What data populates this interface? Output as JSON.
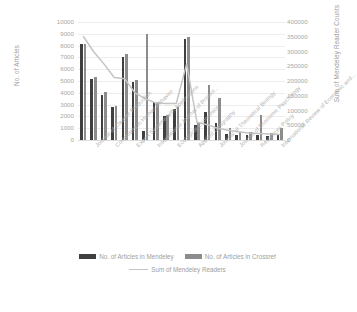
{
  "chart_data": {
    "type": "bar",
    "title": "",
    "xlabel": "",
    "ylabel": "No. of Articles",
    "y2label": "Sum of Mendeley Reader Counts",
    "ylim": [
      0,
      10000
    ],
    "y2lim": [
      0,
      400000
    ],
    "grid": true,
    "legend_position": "bottom",
    "categories": [
      "Journal of Cleaner Production",
      "Computers in Human Behavior",
      "Expert Systems with Applications",
      "International Journal of Project…",
      "Ecological Economics",
      "Applied Geography",
      "Journal of Theoretical Biology",
      "Journal of Economic Psychology",
      "Resources Policy",
      "International Review of Economic and…"
    ],
    "yticks": [
      "0",
      "1000",
      "2000",
      "3000",
      "4000",
      "5000",
      "6000",
      "7000",
      "8000",
      "9000",
      "10000"
    ],
    "y2ticks": [
      "0",
      "50000",
      "100000",
      "150000",
      "200000",
      "250000",
      "300000",
      "350000",
      "400000"
    ],
    "series": [
      {
        "name": "No. of Articles in Mendeley",
        "type": "bar",
        "axis": "left",
        "color": "#3f3f3f",
        "values": [
          8150,
          5200,
          3800,
          2800,
          7050,
          4900,
          800,
          3200,
          2050,
          2600
        ]
      },
      {
        "name": "No. of Articles in Crossref",
        "type": "bar",
        "axis": "left",
        "color": "#8c8c8c",
        "values": [
          8150,
          5350,
          4050,
          2900,
          7300,
          5050,
          8950,
          3200,
          2150,
          2800
        ]
      },
      {
        "name": "Sum of Mendeley Readers",
        "type": "line",
        "axis": "right",
        "color": "#c4c4c4",
        "values": [
          352000,
          300000,
          258000,
          212000,
          208000,
          160000,
          140000,
          126000,
          124000,
          124000
        ]
      }
    ],
    "series2": [
      {
        "name": "No. of Articles in Mendeley",
        "values": [
          8600,
          1250,
          2350,
          1400,
          500,
          450,
          400,
          420,
          380,
          400
        ]
      },
      {
        "name": "No. of Articles in Crossref",
        "values": [
          8700,
          1400,
          4650,
          3600,
          1000,
          700,
          650,
          2100,
          620,
          1050
        ]
      },
      {
        "name": "Sum of Mendeley Readers",
        "values": [
          258000,
          60000,
          52000,
          40000,
          33000,
          28000,
          24000,
          22000,
          20000,
          19000
        ]
      }
    ]
  },
  "legend": {
    "items": [
      {
        "label": "No. of Articles in Mendeley",
        "color": "#3f3f3f",
        "kind": "bar"
      },
      {
        "label": "No. of Articles in Crossref",
        "color": "#8c8c8c",
        "kind": "bar"
      },
      {
        "label": "Sum of Mendeley Readers",
        "color": "#c4c4c4",
        "kind": "line"
      }
    ]
  }
}
